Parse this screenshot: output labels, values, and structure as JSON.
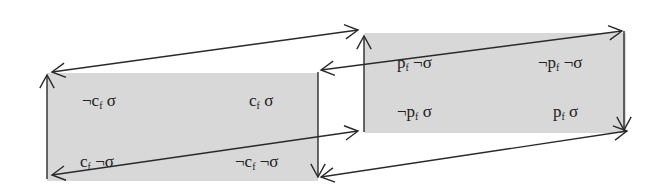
{
  "diagram": {
    "colors": {
      "box_fill": "#d8d8d8",
      "stroke": "#2a2a2a",
      "text": "#222222",
      "background": "#ffffff"
    },
    "left_box": {
      "cells": [
        {
          "id": "tl",
          "neg1": "¬",
          "var": "c",
          "sub": "f",
          "neg2": "",
          "sym": "σ"
        },
        {
          "id": "tr",
          "neg1": "",
          "var": "c",
          "sub": "f",
          "neg2": "",
          "sym": "σ"
        },
        {
          "id": "bl",
          "neg1": "",
          "var": "c",
          "sub": "f",
          "neg2": "¬",
          "sym": "σ"
        },
        {
          "id": "br",
          "neg1": "¬",
          "var": "c",
          "sub": "f",
          "neg2": "¬",
          "sym": "σ"
        }
      ]
    },
    "right_box": {
      "cells": [
        {
          "id": "tl",
          "neg1": "",
          "var": "p",
          "sub": "f",
          "neg2": "¬",
          "sym": "σ"
        },
        {
          "id": "tr",
          "neg1": "¬",
          "var": "p",
          "sub": "f",
          "neg2": "¬",
          "sym": "σ"
        },
        {
          "id": "bl",
          "neg1": "¬",
          "var": "p",
          "sub": "f",
          "neg2": "",
          "sym": "σ"
        },
        {
          "id": "br",
          "neg1": "",
          "var": "p",
          "sub": "f",
          "neg2": "",
          "sym": "σ"
        }
      ]
    },
    "arrows": [
      {
        "name": "left-box-left-edge-up",
        "from": [
          47,
          179
        ],
        "to": [
          47,
          75
        ],
        "heads": "end"
      },
      {
        "name": "left-box-right-edge-down",
        "from": [
          318,
          72
        ],
        "to": [
          318,
          177
        ],
        "heads": "end"
      },
      {
        "name": "right-box-left-edge-up",
        "from": [
          364,
          132
        ],
        "to": [
          364,
          36
        ],
        "heads": "end"
      },
      {
        "name": "right-box-right-edge-down",
        "from": [
          624,
          31
        ],
        "to": [
          624,
          130
        ],
        "heads": "end"
      },
      {
        "name": "top-outer-diagonal",
        "from": [
          52,
          72
        ],
        "to": [
          358,
          30
        ],
        "heads": "both"
      },
      {
        "name": "top-inner-diagonal",
        "from": [
          321,
          70
        ],
        "to": [
          622,
          31
        ],
        "heads": "both"
      },
      {
        "name": "bottom-inner-diagonal",
        "from": [
          52,
          175
        ],
        "to": [
          358,
          131
        ],
        "heads": "both"
      },
      {
        "name": "bottom-outer-diagonal",
        "from": [
          321,
          177
        ],
        "to": [
          627,
          131
        ],
        "heads": "both"
      }
    ]
  }
}
